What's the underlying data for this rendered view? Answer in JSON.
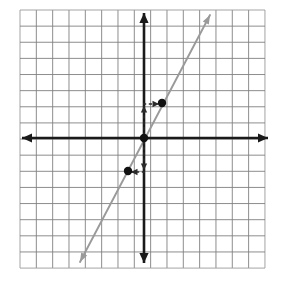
{
  "figure": {
    "background_color": "#ffffff",
    "width": 282,
    "height": 285
  },
  "grid": {
    "label": "Graph paper grid",
    "left": 20,
    "top": 10,
    "right": 265,
    "bottom": 268,
    "columns": 15,
    "rows": 16,
    "cell_width": 16.33,
    "cell_height": 16.13,
    "line_color": "#808080",
    "line_width": 0.9,
    "border_color": "#9a9a9a"
  },
  "axes": {
    "color": "#1a1a1a",
    "line_width": 2.6,
    "origin": {
      "x": 144,
      "y": 138
    },
    "x_axis": {
      "label": "x-axis",
      "x_start": 22,
      "x_end": 268,
      "y": 138,
      "arrow_left": true,
      "arrow_right": true
    },
    "y_axis": {
      "label": "y-axis",
      "y_start": 13,
      "y_end": 263,
      "x": 144,
      "arrow_up": true,
      "arrow_down": true
    }
  },
  "chart_data": {
    "type": "line",
    "xlabel": "x",
    "ylabel": "y",
    "xlim": [
      -7.6,
      7.4
    ],
    "ylim": [
      -8.1,
      7.9
    ],
    "grid": true,
    "legend": "none",
    "series": [
      {
        "name": "line",
        "equation": "y = 2x",
        "slope": 2,
        "y_intercept": 0,
        "color": "#9a9a9a",
        "x": [
          -3.9,
          4.0
        ],
        "y": [
          -7.7,
          7.6
        ],
        "arrow_start": true,
        "arrow_end": true,
        "pixel_start": {
          "x": 80,
          "y": 262
        },
        "pixel_end": {
          "x": 210,
          "y": 15
        }
      }
    ],
    "points": [
      {
        "name": "point-upper",
        "x": 1,
        "y": 2,
        "px": 162,
        "py": 103,
        "color": "#111111",
        "radius": 4.2
      },
      {
        "name": "point-origin",
        "x": 0,
        "y": 0,
        "px": 144,
        "py": 138,
        "color": "#111111",
        "radius": 4.2
      },
      {
        "name": "point-lower",
        "x": -1,
        "y": -2,
        "px": 128,
        "py": 171,
        "color": "#111111",
        "radius": 4.2
      }
    ],
    "annotations": [
      {
        "name": "rise-up-arrow",
        "kind": "dashed-arrow",
        "description": "vertical dashed arrow rise of 2 units up from origin",
        "from": {
          "x": 144,
          "y": 136
        },
        "to": {
          "x": 144,
          "y": 106
        },
        "direction": "up",
        "color": "#2b2b2b"
      },
      {
        "name": "run-right-arrow",
        "kind": "dashed-arrow",
        "description": "horizontal dashed arrow run of 1 unit right to the upper point",
        "from": {
          "x": 143,
          "y": 104
        },
        "to": {
          "x": 159,
          "y": 104
        },
        "direction": "right",
        "color": "#2b2b2b"
      },
      {
        "name": "rise-down-arrow",
        "kind": "dashed-arrow",
        "description": "vertical dashed arrow drop of 2 units down from origin",
        "from": {
          "x": 144,
          "y": 141
        },
        "to": {
          "x": 144,
          "y": 170
        },
        "direction": "down",
        "color": "#2b2b2b"
      },
      {
        "name": "run-left-arrow",
        "kind": "dashed-arrow",
        "description": "horizontal dashed arrow run of 1 unit left to the lower point",
        "from": {
          "x": 145,
          "y": 172
        },
        "to": {
          "x": 131,
          "y": 172
        },
        "direction": "left",
        "color": "#2b2b2b"
      }
    ]
  }
}
